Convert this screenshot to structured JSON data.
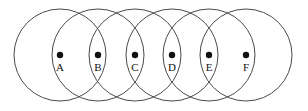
{
  "figure": {
    "canvas": {
      "width": 308,
      "height": 111
    },
    "background_color": "#ffffff",
    "stroke_color": "#4a4a4a",
    "dot_color": "#111111",
    "label_color": "#111111",
    "circle_radius": 46,
    "center_y": 55,
    "dot_radius": 3.2,
    "points": [
      {
        "label": "A",
        "cx": 60,
        "cy": 55,
        "label_x": 60,
        "label_y": 71
      },
      {
        "label": "B",
        "cx": 98,
        "cy": 55,
        "label_x": 98,
        "label_y": 71
      },
      {
        "label": "C",
        "cx": 135,
        "cy": 55,
        "label_x": 135,
        "label_y": 71
      },
      {
        "label": "D",
        "cx": 172,
        "cy": 55,
        "label_x": 172,
        "label_y": 71
      },
      {
        "label": "E",
        "cx": 209,
        "cy": 55,
        "label_x": 209,
        "label_y": 71
      },
      {
        "label": "F",
        "cx": 246,
        "cy": 55,
        "label_x": 246,
        "label_y": 71
      }
    ]
  }
}
